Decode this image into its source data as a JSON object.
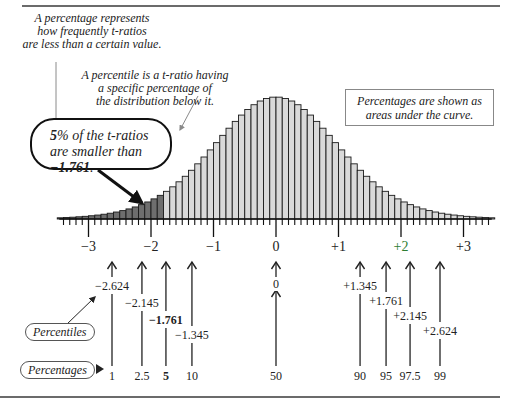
{
  "notes": {
    "percentage_def": [
      "A percentage represents",
      "how frequently t-ratios",
      "are less than a certain value."
    ],
    "percentile_def": [
      "A percentile is a t-ratio having",
      "a specific percentage of",
      "the distribution below it."
    ],
    "callout_bold": "5",
    "callout_line1_rest": "% of the t-ratios",
    "callout_line2_pre": "are smaller than ",
    "callout_value": "−1.761",
    "callout_line2_post": ".",
    "areas_note": [
      "Percentages are shown as",
      "areas under the curve."
    ]
  },
  "tags": {
    "percentiles": "Percentiles",
    "percentages": "Percentages"
  },
  "axis": {
    "labels": [
      {
        "value": -3,
        "text": "−3"
      },
      {
        "value": -2,
        "text": "−2"
      },
      {
        "value": -1,
        "text": "−1"
      },
      {
        "value": 0,
        "text": "0"
      },
      {
        "value": 1,
        "text": "+1"
      },
      {
        "value": 2,
        "text": "+2"
      },
      {
        "value": 3,
        "text": "+3"
      }
    ]
  },
  "colors": {
    "bar_light": "#d9d9d9",
    "bar_dark": "#6e6e6e",
    "bar_stroke": "#1a1a1a",
    "highlight_label": "#2e7d32"
  },
  "chart_data": {
    "type": "bar",
    "title": "",
    "xlabel": "t-ratio",
    "ylabel": "",
    "xlim": [
      -3.5,
      3.5
    ],
    "bin_width": 0.1,
    "shaded_below": -1.761,
    "percentiles": [
      {
        "percentage": 1,
        "percentile": -2.624
      },
      {
        "percentage": 2.5,
        "percentile": -2.145
      },
      {
        "percentage": 5,
        "percentile": -1.761,
        "emphasis": true
      },
      {
        "percentage": 10,
        "percentile": -1.345
      },
      {
        "percentage": 50,
        "percentile": 0
      },
      {
        "percentage": 90,
        "percentile": 1.345
      },
      {
        "percentage": 95,
        "percentile": 1.761
      },
      {
        "percentage": 97.5,
        "percentile": 2.145
      },
      {
        "percentage": 99,
        "percentile": 2.624
      }
    ],
    "percentile_labels": [
      "−2.624",
      "−2.145",
      "−1.761",
      "−1.345",
      "0",
      "+1.345",
      "+1.761",
      "+2.145",
      "+2.624"
    ],
    "percentage_labels": [
      "1",
      "2.5",
      "5",
      "10",
      "50",
      "90",
      "95",
      "97.5",
      "99"
    ],
    "degrees_of_freedom": 14
  }
}
